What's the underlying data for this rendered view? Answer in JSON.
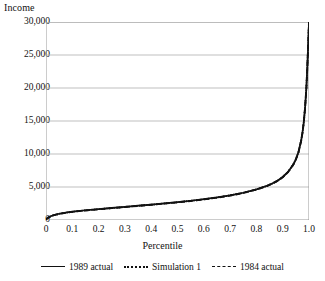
{
  "chart_data": {
    "type": "line",
    "title": "",
    "xlabel": "Percentile",
    "ylabel": "Income",
    "xlim": [
      0,
      1.0
    ],
    "ylim": [
      0,
      30000
    ],
    "grid": "horizontal",
    "legend_position": "bottom",
    "xticks": [
      "0",
      "0.1",
      "0.2",
      "0.3",
      "0.4",
      "0.5",
      "0.6",
      "0.7",
      "0.8",
      "0.9",
      "1.0"
    ],
    "xtick_values": [
      0,
      0.1,
      0.2,
      0.3,
      0.4,
      0.5,
      0.6,
      0.7,
      0.8,
      0.9,
      1.0
    ],
    "yticks": [
      "0",
      "5,000",
      "10,000",
      "15,000",
      "20,000",
      "25,000",
      "30,000"
    ],
    "ytick_values": [
      0,
      5000,
      10000,
      15000,
      20000,
      25000,
      30000
    ],
    "x": [
      0,
      0.01,
      0.02,
      0.03,
      0.05,
      0.08,
      0.1,
      0.15,
      0.2,
      0.25,
      0.3,
      0.35,
      0.4,
      0.45,
      0.5,
      0.55,
      0.6,
      0.65,
      0.7,
      0.75,
      0.8,
      0.84,
      0.86,
      0.88,
      0.9,
      0.92,
      0.94,
      0.95,
      0.96,
      0.97,
      0.975,
      0.98,
      0.985,
      0.99,
      0.993,
      0.996,
      0.998,
      1.0
    ],
    "series": [
      {
        "name": "1989 actual",
        "style": "solid",
        "color": "#111111",
        "values": [
          120,
          420,
          620,
          760,
          950,
          1150,
          1260,
          1480,
          1660,
          1830,
          2000,
          2170,
          2340,
          2520,
          2710,
          2920,
          3150,
          3420,
          3740,
          4130,
          4640,
          5180,
          5530,
          5960,
          6520,
          7280,
          8400,
          9200,
          10300,
          12000,
          13200,
          14800,
          17000,
          20000,
          22600,
          25600,
          27800,
          30000
        ]
      },
      {
        "name": "Simulation 1",
        "style": "dotted",
        "color": "#111111",
        "values": [
          110,
          400,
          600,
          740,
          930,
          1130,
          1240,
          1455,
          1635,
          1805,
          1975,
          2145,
          2315,
          2495,
          2685,
          2895,
          3125,
          3395,
          3715,
          4105,
          4615,
          5155,
          5505,
          5935,
          6495,
          7255,
          8375,
          9175,
          10275,
          11975,
          13175,
          14775,
          16975,
          19975,
          22575,
          25575,
          27775,
          30000
        ]
      },
      {
        "name": "1984 actual",
        "style": "dashed",
        "color": "#111111",
        "values": [
          100,
          390,
          590,
          730,
          920,
          1120,
          1230,
          1445,
          1625,
          1795,
          1965,
          2135,
          2305,
          2485,
          2675,
          2885,
          3115,
          3385,
          3705,
          4095,
          4605,
          5145,
          5495,
          5925,
          6485,
          7245,
          8365,
          9165,
          10265,
          11965,
          13165,
          14765,
          16965,
          19965,
          22565,
          25565,
          27765,
          30000
        ]
      }
    ]
  }
}
